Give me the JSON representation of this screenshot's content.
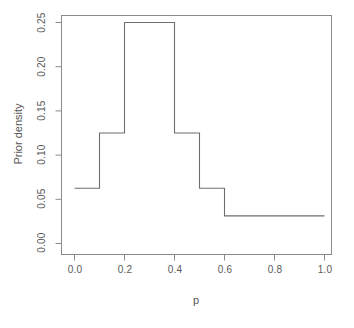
{
  "chart_data": {
    "type": "line",
    "title": "",
    "xlabel": "p",
    "ylabel": "Prior density",
    "xlim": [
      0.0,
      1.0
    ],
    "ylim": [
      0.0,
      0.25
    ],
    "grid": false,
    "legend": "none",
    "x_ticks": [
      "0.0",
      "0.2",
      "0.4",
      "0.6",
      "0.8",
      "1.0"
    ],
    "x_tick_values": [
      0.0,
      0.2,
      0.4,
      0.6,
      0.8,
      1.0
    ],
    "y_ticks": [
      "0.00",
      "0.05",
      "0.10",
      "0.15",
      "0.20",
      "0.25"
    ],
    "y_tick_values": [
      0.0,
      0.05,
      0.1,
      0.15,
      0.2,
      0.25
    ],
    "step_style": "post",
    "bin_edges": [
      0.0,
      0.1,
      0.2,
      0.4,
      0.5,
      0.6,
      1.0
    ],
    "values": [
      0.0625,
      0.125,
      0.25,
      0.125,
      0.0625,
      0.03125
    ],
    "series": [
      {
        "name": "Prior density",
        "x": [
          0.0,
          0.1,
          0.1,
          0.2,
          0.2,
          0.4,
          0.4,
          0.5,
          0.5,
          0.6,
          0.6,
          1.0
        ],
        "y": [
          0.0625,
          0.0625,
          0.125,
          0.125,
          0.25,
          0.25,
          0.125,
          0.125,
          0.0625,
          0.0625,
          0.03125,
          0.03125
        ]
      }
    ],
    "line_color": "#6e6e6e",
    "box_color": "#8a8a8a",
    "background": "#ffffff"
  },
  "axes": {
    "x_title": "p",
    "y_title": "Prior density",
    "x_tick_labels": [
      "0.0",
      "0.2",
      "0.4",
      "0.6",
      "0.8",
      "1.0"
    ],
    "y_tick_labels": [
      "0.00",
      "0.05",
      "0.10",
      "0.15",
      "0.20",
      "0.25"
    ]
  }
}
